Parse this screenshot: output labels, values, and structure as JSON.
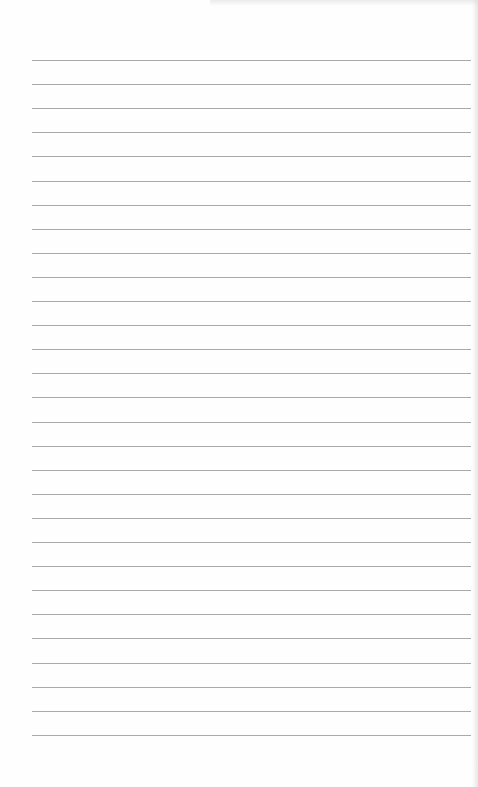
{
  "document": {
    "type": "lined-paper",
    "colors": {
      "paper": "#fefefe",
      "rule": "#9a9a9a"
    },
    "rules": {
      "count": 29,
      "first_y": 60,
      "spacing": 24.1,
      "left": 32,
      "right": 471
    },
    "text": []
  }
}
